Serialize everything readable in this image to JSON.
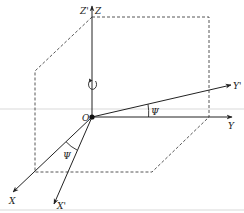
{
  "diagram": {
    "type": "3d-coordinate-rotation",
    "colors": {
      "axis": "#222222",
      "dashed": "#444444",
      "guide": "#c8c8c8",
      "background": "#ffffff"
    },
    "origin": {
      "label": "O",
      "x": 92,
      "y": 117
    },
    "axes": [
      {
        "id": "z",
        "label": "Z",
        "x2": 92,
        "y2": 5
      },
      {
        "id": "z-prime",
        "label": "Z'",
        "x2": 92,
        "y2": 5
      },
      {
        "id": "y",
        "label": "Y",
        "x2": 233,
        "y2": 117
      },
      {
        "id": "y-prime",
        "label": "Y'",
        "x2": 232,
        "y2": 85
      },
      {
        "id": "x",
        "label": "X",
        "x2": 12,
        "y2": 193
      },
      {
        "id": "x-prime",
        "label": "X'",
        "x2": 53,
        "y2": 205
      }
    ],
    "angles": [
      {
        "id": "psi-y",
        "label": "Ψ",
        "between": [
          "Y",
          "Y'"
        ]
      },
      {
        "id": "psi-x",
        "label": "Ψ",
        "between": [
          "X",
          "X'"
        ]
      }
    ],
    "rotation_symbol": {
      "about": "Z",
      "direction": "counterclockwise"
    },
    "labels": {
      "z_pair": "Z'",
      "z": "Z",
      "origin": "O",
      "y": "Y",
      "y_prime": "Y'",
      "x": "X",
      "x_prime": "X'",
      "psi_upper": "Ψ",
      "psi_lower": "Ψ"
    }
  }
}
